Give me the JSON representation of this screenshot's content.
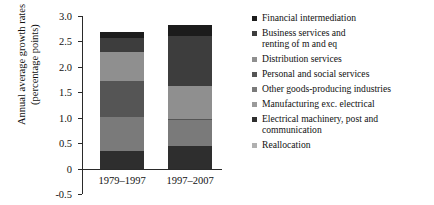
{
  "chart_data": {
    "type": "bar",
    "subtype": "stacked-bar",
    "title": "",
    "xlabel": "",
    "ylabel": "Annual average growth rates\n(percentage points)",
    "ylim": [
      -0.5,
      3.0
    ],
    "ytick_labels": [
      "3.0",
      "2.5",
      "2.0",
      "1.5",
      "1.0",
      "0.5",
      "0",
      "-0.5"
    ],
    "ytick_values": [
      3.0,
      2.5,
      2.0,
      1.5,
      1.0,
      0.5,
      0,
      -0.5
    ],
    "grid": false,
    "legend_position": "right",
    "categories": [
      "1979–1997",
      "1997–2007"
    ],
    "series": [
      {
        "name": "Financial intermediation",
        "color": "#1c1c1c",
        "values": [
          0.13,
          0.22
        ]
      },
      {
        "name": "Business services and\nrenting of m and eq",
        "color": "#3d3d3d",
        "values": [
          0.26,
          0.97
        ]
      },
      {
        "name": "Distribution services",
        "color": "#8f8f8f",
        "values": [
          0.58,
          0.66
        ]
      },
      {
        "name": "Personal and social services",
        "color": "#555555",
        "values": [
          0.71,
          0.02
        ]
      },
      {
        "name": "Other goods-producing industries",
        "color": "#7a7a7a",
        "values": [
          0.67,
          0.51
        ]
      },
      {
        "name": "Manufacturing exc. electrical",
        "color": "#9a9a9a",
        "values": [
          0.0,
          0.0
        ]
      },
      {
        "name": "Electrical machinery, post and\ncommunication",
        "color": "#2e2e2e",
        "values": [
          0.34,
          0.44
        ]
      },
      {
        "name": "Reallocation",
        "color": "#b0b0b0",
        "values": [
          0.0,
          0.0
        ]
      }
    ],
    "totals": [
      2.69,
      2.82
    ]
  }
}
